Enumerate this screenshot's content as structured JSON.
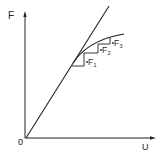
{
  "diagram": {
    "type": "force-displacement",
    "axes": {
      "y_label": "F",
      "x_label": "U",
      "origin_label": "0"
    },
    "curves": [
      {
        "name": "linear-line",
        "description": "straight line from origin"
      },
      {
        "name": "nonlinear-curve",
        "description": "softening curve tangent to line"
      }
    ],
    "steps": [
      {
        "label": "F",
        "sub": "1"
      },
      {
        "label": "F",
        "sub": "2"
      },
      {
        "label": "F",
        "sub": "3"
      }
    ],
    "colors": {
      "stroke": "#222222",
      "background": "#ffffff"
    }
  }
}
